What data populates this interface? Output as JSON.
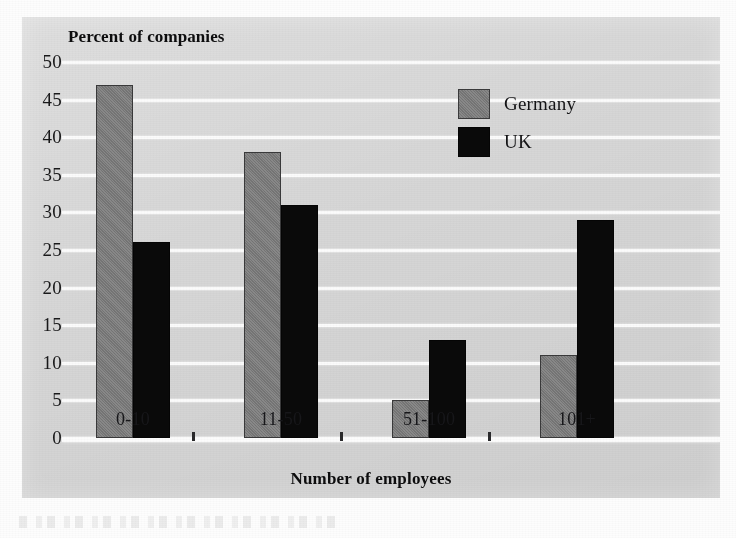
{
  "chart_data": {
    "type": "bar",
    "title": "",
    "ylabel": "Percent of companies",
    "xlabel": "Number of employees",
    "categories": [
      "0-10",
      "11-50",
      "51-100",
      "101+"
    ],
    "series": [
      {
        "name": "Germany",
        "color": "#7c7c7c",
        "values": [
          47,
          38,
          5,
          11
        ]
      },
      {
        "name": "UK",
        "color": "#0a0a0a",
        "values": [
          26,
          31,
          13,
          29
        ]
      }
    ],
    "ylim": [
      0,
      50
    ],
    "yticks": [
      50,
      45,
      40,
      35,
      30,
      25,
      20,
      15,
      10,
      5,
      0
    ],
    "ytick_step": 5,
    "grid": true,
    "grid_axis": "y",
    "legend_position": "upper-right",
    "panel_background": "#d6d6d6",
    "gridline_color": "#fbfbfb"
  },
  "axes": {
    "y_title": "Percent of companies",
    "x_title": "Number of employees",
    "y_ticks": [
      "50",
      "45",
      "40",
      "35",
      "30",
      "25",
      "20",
      "15",
      "10",
      "5",
      "0"
    ],
    "x_ticks": [
      "0-10",
      "11-50",
      "51-100",
      "101+"
    ]
  },
  "legend": {
    "entries": [
      {
        "label": "Germany",
        "swatch": "germany"
      },
      {
        "label": "UK",
        "swatch": "uk"
      }
    ]
  }
}
